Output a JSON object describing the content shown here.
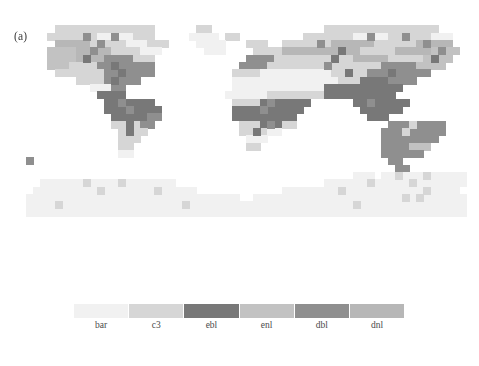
{
  "figure": {
    "panel_label": "(a)",
    "background_color": "#ffffff"
  },
  "chart_data": {
    "type": "heatmap",
    "title": "(a)",
    "subtitle": "",
    "xlabel": "",
    "ylabel": "",
    "projection": "equirectangular",
    "grid": false,
    "legend_position": "bottom",
    "xlim": [
      -180,
      180
    ],
    "ylim": [
      -90,
      90
    ],
    "xtick_labels": [],
    "ytick_labels": [],
    "categories": [
      "bar",
      "c3",
      "ebl",
      "enl",
      "dbl",
      "dnl"
    ],
    "category_colors": [
      "#f1f1f1",
      "#d6d6d6",
      "#787878",
      "#c2c2c2",
      "#8f8f8f",
      "#b7b7b7"
    ],
    "category_long_names": [
      "bare soil",
      "C3 grass",
      "evergreen broadleaf",
      "evergreen needleleaf",
      "deciduous broadleaf",
      "deciduous needleleaf"
    ],
    "ocean_color": "#ffffff",
    "cell_size_deg": 5.625,
    "n_cols": 64,
    "n_rows": 36,
    "values_note": "Grid of category indices (0=bar,1=c3,2=ebl,3=enl,4=dbl,5=dnl, -1=ocean/no data), row 0 = northernmost.",
    "grid_values": [
      [
        -1,
        -1,
        -1,
        -1,
        -1,
        -1,
        -1,
        -1,
        -1,
        -1,
        -1,
        -1,
        -1,
        -1,
        -1,
        -1,
        -1,
        -1,
        -1,
        -1,
        -1,
        -1,
        -1,
        -1,
        -1,
        -1,
        -1,
        -1,
        -1,
        -1,
        -1,
        -1,
        -1,
        -1,
        -1,
        -1,
        -1,
        -1,
        -1,
        -1,
        -1,
        -1,
        -1,
        -1,
        -1,
        -1,
        -1,
        -1,
        -1,
        -1,
        -1,
        -1,
        -1,
        -1,
        -1,
        -1,
        -1,
        -1,
        -1,
        -1,
        -1,
        -1,
        -1,
        -1
      ],
      [
        -1,
        -1,
        -1,
        -1,
        -1,
        -1,
        -1,
        -1,
        -1,
        -1,
        -1,
        -1,
        -1,
        -1,
        -1,
        -1,
        -1,
        -1,
        -1,
        -1,
        -1,
        -1,
        -1,
        -1,
        -1,
        -1,
        -1,
        -1,
        -1,
        -1,
        -1,
        -1,
        -1,
        -1,
        -1,
        -1,
        -1,
        -1,
        -1,
        -1,
        -1,
        -1,
        -1,
        -1,
        -1,
        -1,
        -1,
        -1,
        -1,
        -1,
        -1,
        -1,
        -1,
        -1,
        -1,
        -1,
        -1,
        -1,
        -1,
        -1,
        -1,
        -1,
        -1,
        -1
      ],
      [
        -1,
        -1,
        -1,
        -1,
        -1,
        -1,
        1,
        1,
        1,
        1,
        1,
        1,
        1,
        1,
        1,
        1,
        1,
        1,
        1,
        1,
        1,
        1,
        1,
        1,
        1,
        1,
        1,
        -1,
        -1,
        -1,
        -1,
        -1,
        -1,
        -1,
        -1,
        -1,
        -1,
        -1,
        -1,
        -1,
        -1,
        -1,
        -1,
        -1,
        -1,
        -1,
        -1,
        -1,
        -1,
        -1,
        -1,
        -1,
        -1,
        -1,
        -1,
        -1,
        -1,
        -1,
        -1,
        -1,
        -1,
        -1,
        -1,
        -1
      ],
      [
        -1,
        -1,
        -1,
        -1,
        -1,
        -1,
        1,
        1,
        1,
        1,
        1,
        1,
        1,
        1,
        1,
        1,
        1,
        1,
        1,
        1,
        1,
        1,
        1,
        1,
        1,
        1,
        1,
        -1,
        -1,
        -1,
        -1,
        -1,
        -1,
        -1,
        -1,
        -1,
        -1,
        -1,
        -1,
        -1,
        -1,
        -1,
        -1,
        -1,
        -1,
        -1,
        -1,
        -1,
        -1,
        -1,
        -1,
        -1,
        -1,
        -1,
        -1,
        -1,
        -1,
        -1,
        -1,
        -1,
        -1,
        -1,
        -1,
        -1
      ],
      [
        -1,
        -1,
        -1,
        -1,
        -1,
        -1,
        1,
        1,
        1,
        1,
        1,
        1,
        1,
        1,
        1,
        1,
        1,
        1,
        1,
        1,
        -1,
        -1,
        -1,
        -1,
        -1,
        -1,
        -1,
        -1,
        -1,
        -1,
        -1,
        -1,
        -1,
        -1,
        -1,
        -1,
        -1,
        -1,
        -1,
        -1,
        -1,
        -1,
        -1,
        -1,
        -1,
        -1,
        -1,
        -1,
        -1,
        -1,
        -1,
        -1,
        -1,
        -1,
        -1,
        -1,
        -1,
        -1,
        -1,
        -1,
        -1,
        -1,
        -1,
        -1
      ],
      [
        -1,
        -1,
        -1,
        -1,
        -1,
        -1,
        -1,
        -1,
        -1,
        -1,
        -1,
        -1,
        -1,
        -1,
        -1,
        -1,
        -1,
        -1,
        -1,
        -1,
        -1,
        -1,
        -1,
        -1,
        -1,
        -1,
        -1,
        -1,
        -1,
        -1,
        -1,
        -1,
        -1,
        -1,
        -1,
        -1,
        -1,
        -1,
        -1,
        -1,
        -1,
        -1,
        -1,
        -1,
        -1,
        -1,
        -1,
        -1,
        -1,
        -1,
        -1,
        -1,
        -1,
        -1,
        -1,
        -1,
        -1,
        -1,
        -1,
        -1,
        -1,
        -1,
        -1,
        -1
      ],
      [
        -1,
        -1,
        -1,
        -1,
        -1,
        -1,
        -1,
        -1,
        -1,
        -1,
        -1,
        -1,
        -1,
        -1,
        -1,
        -1,
        -1,
        -1,
        -1,
        -1,
        -1,
        -1,
        -1,
        -1,
        -1,
        -1,
        -1,
        -1,
        -1,
        -1,
        -1,
        -1,
        -1,
        -1,
        -1,
        -1,
        -1,
        -1,
        -1,
        -1,
        -1,
        -1,
        -1,
        -1,
        -1,
        -1,
        -1,
        -1,
        -1,
        -1,
        -1,
        -1,
        -1,
        -1,
        -1,
        -1,
        -1,
        -1,
        -1,
        -1,
        -1,
        -1,
        -1,
        -1
      ],
      [
        -1,
        -1,
        -1,
        -1,
        -1,
        -1,
        -1,
        -1,
        -1,
        -1,
        -1,
        -1,
        -1,
        -1,
        -1,
        -1,
        -1,
        -1,
        -1,
        -1,
        -1,
        -1,
        -1,
        -1,
        -1,
        -1,
        -1,
        -1,
        -1,
        -1,
        -1,
        -1,
        -1,
        -1,
        -1,
        -1,
        -1,
        -1,
        -1,
        -1,
        -1,
        -1,
        -1,
        -1,
        -1,
        -1,
        -1,
        -1,
        -1,
        -1,
        -1,
        -1,
        -1,
        -1,
        -1,
        -1,
        -1,
        -1,
        -1,
        -1,
        -1,
        -1,
        -1,
        -1
      ],
      [
        -1,
        -1,
        -1,
        -1,
        -1,
        -1,
        -1,
        -1,
        -1,
        -1,
        -1,
        -1,
        -1,
        -1,
        -1,
        -1,
        -1,
        -1,
        -1,
        -1,
        -1,
        -1,
        -1,
        -1,
        -1,
        -1,
        -1,
        -1,
        -1,
        -1,
        -1,
        -1,
        -1,
        -1,
        -1,
        -1,
        -1,
        -1,
        -1,
        -1,
        -1,
        -1,
        -1,
        -1,
        -1,
        -1,
        -1,
        -1,
        -1,
        -1,
        -1,
        -1,
        -1,
        -1,
        -1,
        -1,
        -1,
        -1,
        -1,
        -1,
        -1,
        -1,
        -1,
        -1
      ],
      [
        -1,
        -1,
        -1,
        -1,
        -1,
        -1,
        -1,
        -1,
        -1,
        -1,
        -1,
        -1,
        -1,
        -1,
        -1,
        -1,
        -1,
        -1,
        -1,
        -1,
        -1,
        -1,
        -1,
        -1,
        -1,
        -1,
        -1,
        -1,
        -1,
        -1,
        -1,
        -1,
        -1,
        -1,
        -1,
        -1,
        -1,
        -1,
        -1,
        -1,
        -1,
        -1,
        -1,
        -1,
        -1,
        -1,
        -1,
        -1,
        -1,
        -1,
        -1,
        -1,
        -1,
        -1,
        -1,
        -1,
        -1,
        -1,
        -1,
        -1,
        -1,
        -1,
        -1,
        -1
      ],
      [
        -1,
        -1,
        -1,
        -1,
        -1,
        -1,
        -1,
        -1,
        -1,
        -1,
        -1,
        -1,
        -1,
        -1,
        -1,
        -1,
        -1,
        -1,
        -1,
        -1,
        -1,
        -1,
        -1,
        -1,
        -1,
        -1,
        -1,
        -1,
        -1,
        -1,
        -1,
        -1,
        -1,
        -1,
        -1,
        -1,
        -1,
        -1,
        -1,
        -1,
        -1,
        -1,
        -1,
        -1,
        -1,
        -1,
        -1,
        -1,
        -1,
        -1,
        -1,
        -1,
        -1,
        -1,
        -1,
        -1,
        -1,
        -1,
        -1,
        -1,
        -1,
        -1,
        -1,
        -1
      ],
      [
        -1,
        -1,
        -1,
        -1,
        -1,
        -1,
        -1,
        -1,
        -1,
        -1,
        -1,
        -1,
        -1,
        -1,
        -1,
        -1,
        -1,
        -1,
        -1,
        -1,
        -1,
        -1,
        -1,
        -1,
        -1,
        -1,
        -1,
        -1,
        -1,
        -1,
        -1,
        -1,
        -1,
        -1,
        -1,
        -1,
        -1,
        -1,
        -1,
        -1,
        -1,
        -1,
        -1,
        -1,
        -1,
        -1,
        -1,
        -1,
        -1,
        -1,
        -1,
        -1,
        -1,
        -1,
        -1,
        -1,
        -1,
        -1,
        -1,
        -1,
        -1,
        -1,
        -1,
        -1
      ],
      [
        -1,
        -1,
        -1,
        -1,
        -1,
        -1,
        -1,
        -1,
        -1,
        -1,
        -1,
        -1,
        -1,
        -1,
        -1,
        -1,
        -1,
        -1,
        -1,
        -1,
        -1,
        -1,
        -1,
        -1,
        -1,
        -1,
        -1,
        -1,
        -1,
        -1,
        -1,
        -1,
        -1,
        -1,
        -1,
        -1,
        -1,
        -1,
        -1,
        -1,
        -1,
        -1,
        -1,
        -1,
        -1,
        -1,
        -1,
        -1,
        -1,
        -1,
        -1,
        -1,
        -1,
        -1,
        -1,
        -1,
        -1,
        -1,
        -1,
        -1,
        -1,
        -1,
        -1,
        -1
      ],
      [
        -1,
        -1,
        -1,
        -1,
        -1,
        -1,
        -1,
        -1,
        -1,
        -1,
        -1,
        -1,
        -1,
        -1,
        -1,
        -1,
        -1,
        -1,
        -1,
        -1,
        -1,
        -1,
        -1,
        -1,
        -1,
        -1,
        -1,
        -1,
        -1,
        -1,
        -1,
        -1,
        -1,
        -1,
        -1,
        -1,
        -1,
        -1,
        -1,
        -1,
        -1,
        -1,
        -1,
        -1,
        -1,
        -1,
        -1,
        -1,
        -1,
        -1,
        -1,
        -1,
        -1,
        -1,
        -1,
        -1,
        -1,
        -1,
        -1,
        -1,
        -1,
        -1,
        -1,
        -1
      ],
      [
        -1,
        -1,
        -1,
        -1,
        -1,
        -1,
        -1,
        -1,
        -1,
        -1,
        -1,
        -1,
        -1,
        -1,
        -1,
        -1,
        -1,
        -1,
        -1,
        -1,
        -1,
        -1,
        -1,
        -1,
        -1,
        -1,
        -1,
        -1,
        -1,
        -1,
        -1,
        -1,
        -1,
        -1,
        -1,
        -1,
        -1,
        -1,
        -1,
        -1,
        -1,
        -1,
        -1,
        -1,
        -1,
        -1,
        -1,
        -1,
        -1,
        -1,
        -1,
        -1,
        -1,
        -1,
        -1,
        -1,
        -1,
        -1,
        -1,
        -1,
        -1,
        -1,
        -1,
        -1
      ],
      [
        -1,
        -1,
        -1,
        -1,
        -1,
        -1,
        -1,
        -1,
        -1,
        -1,
        -1,
        -1,
        -1,
        -1,
        -1,
        -1,
        -1,
        -1,
        -1,
        -1,
        -1,
        -1,
        -1,
        -1,
        -1,
        -1,
        -1,
        -1,
        -1,
        -1,
        -1,
        -1,
        -1,
        -1,
        -1,
        -1,
        -1,
        -1,
        -1,
        -1,
        -1,
        -1,
        -1,
        -1,
        -1,
        -1,
        -1,
        -1,
        -1,
        -1,
        -1,
        -1,
        -1,
        -1,
        -1,
        -1,
        -1,
        -1,
        -1,
        -1,
        -1,
        -1,
        -1,
        -1
      ],
      [
        -1,
        -1,
        -1,
        -1,
        -1,
        -1,
        -1,
        -1,
        -1,
        -1,
        -1,
        -1,
        -1,
        -1,
        -1,
        -1,
        -1,
        -1,
        -1,
        -1,
        -1,
        -1,
        -1,
        -1,
        -1,
        -1,
        -1,
        -1,
        -1,
        -1,
        -1,
        -1,
        -1,
        -1,
        -1,
        -1,
        -1,
        -1,
        -1,
        -1,
        -1,
        -1,
        -1,
        -1,
        -1,
        -1,
        -1,
        -1,
        -1,
        -1,
        -1,
        -1,
        -1,
        -1,
        -1,
        -1,
        -1,
        -1,
        -1,
        -1,
        -1,
        -1,
        -1,
        -1
      ],
      [
        -1,
        -1,
        -1,
        -1,
        -1,
        -1,
        -1,
        -1,
        -1,
        -1,
        -1,
        -1,
        -1,
        -1,
        -1,
        -1,
        -1,
        -1,
        -1,
        -1,
        -1,
        -1,
        -1,
        -1,
        -1,
        -1,
        -1,
        -1,
        -1,
        -1,
        -1,
        -1,
        -1,
        -1,
        -1,
        -1,
        -1,
        -1,
        -1,
        -1,
        -1,
        -1,
        -1,
        -1,
        -1,
        -1,
        -1,
        -1,
        -1,
        -1,
        -1,
        -1,
        -1,
        -1,
        -1,
        -1,
        -1,
        -1,
        -1,
        -1,
        -1,
        -1,
        -1,
        -1
      ]
    ]
  },
  "legend": {
    "entries": [
      {
        "label": "bar",
        "color": "#f1f1f1"
      },
      {
        "label": "c3",
        "color": "#d6d6d6"
      },
      {
        "label": "ebl",
        "color": "#787878"
      },
      {
        "label": "enl",
        "color": "#c2c2c2"
      },
      {
        "label": "dbl",
        "color": "#8f8f8f"
      },
      {
        "label": "dnl",
        "color": "#b7b7b7"
      }
    ]
  }
}
